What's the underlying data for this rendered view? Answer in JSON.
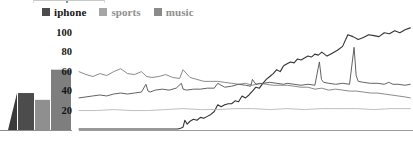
{
  "legend": {
    "position": "top-left",
    "items": [
      {
        "label": "iphone",
        "color": "#4c4c4c",
        "text_color": "#151515"
      },
      {
        "label": "sports",
        "color": "#a6a6a6",
        "text_color": "#8e8e8e"
      },
      {
        "label": "music",
        "color": "#8a8a8a",
        "text_color": "#8e8e8e"
      }
    ]
  },
  "axes": {
    "y_ticks": [
      "20",
      "40",
      "60",
      "80",
      "100"
    ],
    "x_ticks": [
      "2005",
      "2007",
      "2009",
      "2011",
      "2013"
    ]
  },
  "bar_panel": {
    "group_label": "Average"
  },
  "icons": {
    "legend_swatch": "square-swatch-icon"
  },
  "chart_data": [
    {
      "type": "bar",
      "title": "",
      "subtitle": "",
      "xlabel": "Average",
      "ylabel": "",
      "grid": false,
      "legend": "shared with line chart",
      "ylim": [
        0,
        110
      ],
      "categories": [
        "clipped",
        "iphone",
        "sports",
        "music"
      ],
      "values": [
        38,
        38,
        31,
        62
      ],
      "colors": [
        "#3a3a3a",
        "#4c4c4c",
        "#8f8f8f",
        "#7e7e7e"
      ],
      "note": "leftmost shape is a clipped dark wedge at the image edge"
    },
    {
      "type": "line",
      "title": "",
      "subtitle": "",
      "xlabel": "",
      "ylabel": "",
      "grid": false,
      "legend": "top-left",
      "xlim": [
        2004.0,
        2013.6
      ],
      "ylim": [
        0,
        110
      ],
      "x_ticks": [
        2005,
        2007,
        2009,
        2011,
        2013
      ],
      "y_ticks": [
        20,
        40,
        60,
        80,
        100
      ],
      "series": [
        {
          "name": "iphone",
          "color": "#333333",
          "width": 1.1,
          "x": [
            2004.0,
            2004.3,
            2004.6,
            2004.9,
            2005.2,
            2005.5,
            2005.8,
            2006.1,
            2006.4,
            2006.7,
            2006.85,
            2006.95,
            2007.0,
            2007.05,
            2007.12,
            2007.2,
            2007.3,
            2007.4,
            2007.5,
            2007.6,
            2007.7,
            2007.8,
            2007.9,
            2008.0,
            2008.1,
            2008.2,
            2008.3,
            2008.4,
            2008.5,
            2008.6,
            2008.7,
            2008.8,
            2008.9,
            2009.0,
            2009.1,
            2009.2,
            2009.3,
            2009.4,
            2009.5,
            2009.6,
            2009.7,
            2009.8,
            2009.9,
            2010.0,
            2010.1,
            2010.2,
            2010.3,
            2010.4,
            2010.5,
            2010.6,
            2010.7,
            2010.8,
            2010.9,
            2011.0,
            2011.15,
            2011.3,
            2011.45,
            2011.6,
            2011.75,
            2011.9,
            2012.05,
            2012.2,
            2012.35,
            2012.5,
            2012.65,
            2012.8,
            2012.95,
            2013.1,
            2013.25,
            2013.4,
            2013.55
          ],
          "y": [
            1,
            1,
            1,
            1,
            1,
            1,
            1,
            1,
            1,
            1,
            1,
            2,
            3,
            10,
            6,
            9,
            11,
            10,
            13,
            12,
            14,
            16,
            19,
            26,
            24,
            26,
            27,
            27,
            30,
            29,
            35,
            33,
            36,
            40,
            44,
            43,
            48,
            52,
            55,
            58,
            62,
            60,
            66,
            68,
            70,
            69,
            73,
            72,
            74,
            76,
            75,
            78,
            77,
            80,
            76,
            79,
            82,
            86,
            98,
            96,
            93,
            95,
            98,
            97,
            96,
            100,
            99,
            102,
            100,
            103,
            105
          ]
        },
        {
          "name": "sports",
          "color": "#7d7d7d",
          "width": 0.9,
          "x": [
            2004.0,
            2004.2,
            2004.4,
            2004.6,
            2004.8,
            2005.0,
            2005.2,
            2005.4,
            2005.6,
            2005.8,
            2005.95,
            2006.1,
            2006.3,
            2006.5,
            2006.7,
            2006.9,
            2007.0,
            2007.2,
            2007.4,
            2007.6,
            2007.8,
            2008.0,
            2008.2,
            2008.4,
            2008.6,
            2008.8,
            2009.0,
            2009.2,
            2009.4,
            2009.6,
            2009.8,
            2010.0,
            2010.2,
            2010.4,
            2010.6,
            2010.8,
            2011.0,
            2011.2,
            2011.4,
            2011.6,
            2011.8,
            2012.0,
            2012.2,
            2012.4,
            2012.6,
            2012.8,
            2013.0,
            2013.2,
            2013.4,
            2013.55
          ],
          "y": [
            60,
            57,
            55,
            58,
            56,
            60,
            63,
            58,
            57,
            60,
            55,
            54,
            55,
            57,
            54,
            53,
            62,
            54,
            52,
            50,
            50,
            50,
            49,
            48,
            47,
            48,
            46,
            48,
            47,
            46,
            46,
            46,
            45,
            44,
            44,
            42,
            43,
            41,
            42,
            41,
            40,
            40,
            39,
            38,
            38,
            37,
            36,
            35,
            34,
            33
          ]
        },
        {
          "name": "music",
          "color": "#5a5a5a",
          "width": 0.95,
          "x": [
            2004.0,
            2004.2,
            2004.4,
            2004.6,
            2004.8,
            2005.0,
            2005.2,
            2005.4,
            2005.6,
            2005.8,
            2005.93,
            2005.99,
            2006.05,
            2006.2,
            2006.4,
            2006.6,
            2006.8,
            2006.95,
            2007.0,
            2007.1,
            2007.3,
            2007.5,
            2007.7,
            2007.9,
            2008.0,
            2008.2,
            2008.4,
            2008.6,
            2008.8,
            2008.95,
            2009.0,
            2009.1,
            2009.3,
            2009.5,
            2009.7,
            2009.9,
            2010.0,
            2010.2,
            2010.4,
            2010.6,
            2010.8,
            2010.93,
            2010.99,
            2011.05,
            2011.2,
            2011.4,
            2011.6,
            2011.8,
            2011.93,
            2011.99,
            2012.05,
            2012.2,
            2012.4,
            2012.6,
            2012.8,
            2012.93,
            2012.99,
            2013.05,
            2013.2,
            2013.4,
            2013.55
          ],
          "y": [
            33,
            34,
            35,
            36,
            35,
            37,
            38,
            37,
            38,
            39,
            47,
            40,
            39,
            41,
            42,
            41,
            43,
            48,
            42,
            41,
            42,
            42,
            43,
            43,
            48,
            44,
            45,
            47,
            46,
            45,
            52,
            47,
            48,
            49,
            48,
            47,
            48,
            47,
            46,
            47,
            46,
            70,
            52,
            49,
            48,
            47,
            48,
            47,
            85,
            56,
            50,
            49,
            48,
            48,
            47,
            49,
            48,
            47,
            47,
            46,
            47
          ]
        },
        {
          "name": "baseline-flat",
          "color": "#b4b4b4",
          "width": 0.85,
          "x": [
            2004.0,
            2004.5,
            2005.0,
            2005.5,
            2006.0,
            2006.5,
            2007.0,
            2007.5,
            2008.0,
            2008.5,
            2009.0,
            2009.5,
            2010.0,
            2010.5,
            2011.0,
            2011.5,
            2012.0,
            2012.5,
            2013.0,
            2013.55
          ],
          "y": [
            20,
            20,
            21,
            20,
            20,
            21,
            22,
            21,
            21,
            22,
            22,
            21,
            22,
            21,
            22,
            22,
            22,
            21,
            22,
            22
          ]
        }
      ]
    }
  ]
}
